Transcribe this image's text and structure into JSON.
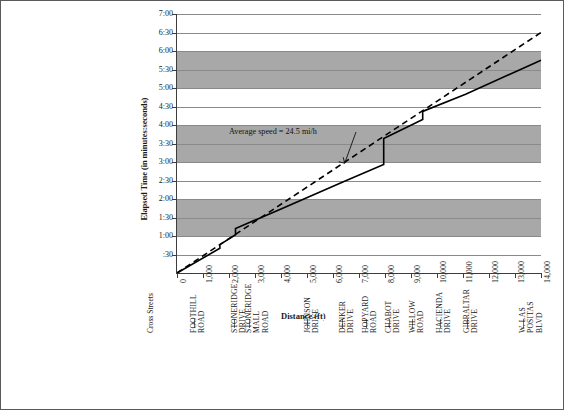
{
  "chart_data": {
    "type": "line",
    "title": "",
    "xlabel": "Distance (ft)",
    "ylabel": "Elapsed Time (in minutes:seconds)",
    "xlim": [
      0,
      14000
    ],
    "ylim": [
      0,
      420
    ],
    "grid": true,
    "legend_position": "none",
    "annotations": [
      {
        "text": "Average speed = 24.5 mi/h",
        "x": 3400,
        "y": 225,
        "arrow_to_x": 6450,
        "arrow_to_y": 178
      }
    ],
    "x_tick_labels": [
      "0",
      "1,000",
      "2,000",
      "3,000",
      "4,000",
      "5,000",
      "6,000",
      "7,000",
      "8,000",
      "9,000",
      "10,000",
      "11,000",
      "12,000",
      "13,000",
      "14,000"
    ],
    "x_tick_values": [
      0,
      1000,
      2000,
      3000,
      4000,
      5000,
      6000,
      7000,
      8000,
      9000,
      10000,
      11000,
      12000,
      13000,
      14000
    ],
    "y_tick_labels": [
      ":30",
      "1:00",
      "1:30",
      "2:00",
      "2:30",
      "3:00",
      "3:30",
      "4:00",
      "4:30",
      "5:00",
      "5:30",
      "6:00",
      "6:30",
      "7:00"
    ],
    "y_tick_values": [
      30,
      60,
      90,
      120,
      150,
      180,
      210,
      240,
      270,
      300,
      330,
      360,
      390,
      420
    ],
    "series": [
      {
        "name": "Observed travel (cumulative time)",
        "style": "solid",
        "points": [
          [
            0,
            0
          ],
          [
            1650,
            40
          ],
          [
            1650,
            46
          ],
          [
            2250,
            62
          ],
          [
            2250,
            72
          ],
          [
            4000,
            104
          ],
          [
            6400,
            148
          ],
          [
            7950,
            176
          ],
          [
            7950,
            218
          ],
          [
            9450,
            249
          ],
          [
            9450,
            262
          ],
          [
            11100,
            290
          ],
          [
            14000,
            345
          ]
        ]
      },
      {
        "name": "Average speed reference line (24.5 mi/h)",
        "style": "dashed",
        "points": [
          [
            0,
            0
          ],
          [
            14000,
            390
          ]
        ]
      }
    ]
  },
  "cross_streets": {
    "title": "Cross Streets",
    "items": [
      {
        "label": "FOOTHILL\nROAD",
        "x": 650
      },
      {
        "label": "STONERIDGE\nDRIVE",
        "x": 2200
      },
      {
        "label": "STONERIDGE\nMALL\nROAD",
        "x": 2750
      },
      {
        "label": "JOHNSON\nDRIVE",
        "x": 5000
      },
      {
        "label": "DENKER\nDRIVE",
        "x": 6350
      },
      {
        "label": "HOPYARD\nROAD",
        "x": 7250
      },
      {
        "label": "CHABOT\nDRIVE",
        "x": 8150
      },
      {
        "label": "WILLOW\nROAD",
        "x": 9050
      },
      {
        "label": "HACIENDA\nDRIVE",
        "x": 10100
      },
      {
        "label": "GIBRALTAR\nDRIVE",
        "x": 11150
      },
      {
        "label": "W. LAS\nPOSITAS\nBLVD",
        "x": 13300
      }
    ]
  },
  "colors": {
    "band": "#a8a8a8",
    "grid": "#8a8a8a",
    "axis": "#3d3d3d",
    "line": "#000000",
    "frame": "#5a5a5a"
  }
}
